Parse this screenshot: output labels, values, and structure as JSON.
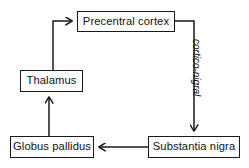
{
  "diagram": {
    "type": "cycle-flowchart",
    "background_color": "#ffffff",
    "line_color": "#1a1a1a",
    "text_color": "#111111",
    "nodes": [
      {
        "id": "precentral_cortex",
        "label": "Precentral cortex"
      },
      {
        "id": "substantia_nigra",
        "label": "Substantia nigra"
      },
      {
        "id": "globus_pallidus",
        "label": "Globus pallidus"
      },
      {
        "id": "thalamus",
        "label": "Thalamus"
      }
    ],
    "edges": [
      {
        "id": "cortex_to_nigra",
        "from": "Precentral cortex",
        "to": "Substantia nigra",
        "label": "cortico-nigral",
        "label_style": "italic"
      },
      {
        "id": "nigra_to_pallidus",
        "from": "Substantia nigra",
        "to": "Globus pallidus",
        "label": ""
      },
      {
        "id": "pallidus_to_thalamus",
        "from": "Globus pallidus",
        "to": "Thalamus",
        "label": ""
      },
      {
        "id": "thalamus_to_cortex",
        "from": "Thalamus",
        "to": "Precentral cortex",
        "label": ""
      }
    ]
  }
}
